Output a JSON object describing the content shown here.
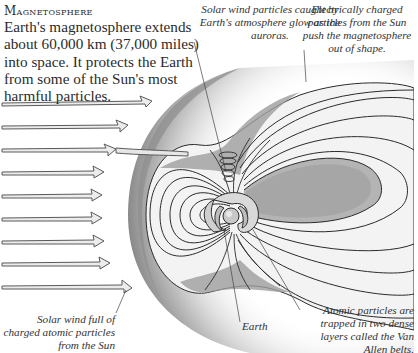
{
  "header": {
    "title": "Magnetosphere",
    "intro": "Earth's magnetosphere extends about 60,000 km (37,000 miles) into space. It protects the Earth from some of the Sun's most harmful particles."
  },
  "captions": {
    "aurora": "Solar wind particles caught by Earth's atmosphere glow as the auroras.",
    "charged": "Electrically charged particles from the Sun push the magnetosphere out of shape.",
    "solar_wind": "Solar wind full of charged atomic particles from the Sun",
    "earth": "Earth",
    "van_allen": "Atomic particles are trapped in two dense layers called the Van Allen belts."
  },
  "diagram": {
    "solar_wind_arrow_count": 8,
    "colors": {
      "ink": "#2b2b2b",
      "shade_dark": "#8c8c8c",
      "shade_mid": "#bdbdbd",
      "shade_light": "#e2e2e2",
      "arrow_fill": "#ececec"
    }
  }
}
